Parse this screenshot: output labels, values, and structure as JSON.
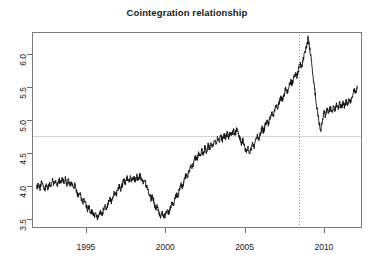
{
  "chart_data": {
    "type": "line",
    "title": "Cointegration relationship",
    "xlabel": "",
    "ylabel": "",
    "xlim": [
      1991.6,
      2012.4
    ],
    "ylim": [
      3.36,
      6.34
    ],
    "grid": false,
    "legend": null,
    "x_ticks": [
      1995,
      2000,
      2005,
      2010
    ],
    "x_tick_labels": [
      "1995",
      "2000",
      "2005",
      "2010"
    ],
    "y_ticks": [
      3.5,
      4.0,
      4.5,
      5.0,
      5.5,
      6.0
    ],
    "y_tick_labels": [
      "3.5",
      "4.0",
      "4.5",
      "5.0",
      "5.5",
      "6.0"
    ],
    "series": [
      {
        "name": "cointegration-relationship",
        "color": "#111111",
        "x": [
          1991.9,
          1992.0,
          1992.1,
          1992.2,
          1992.3,
          1992.4,
          1992.5,
          1992.6,
          1992.7,
          1992.8,
          1992.9,
          1993.0,
          1993.1,
          1993.2,
          1993.3,
          1993.4,
          1993.5,
          1993.6,
          1993.7,
          1993.8,
          1993.9,
          1994.0,
          1994.1,
          1994.2,
          1994.3,
          1994.4,
          1994.5,
          1994.6,
          1994.7,
          1994.8,
          1994.9,
          1995.0,
          1995.1,
          1995.2,
          1995.3,
          1995.4,
          1995.5,
          1995.6,
          1995.7,
          1995.8,
          1995.9,
          1996.0,
          1996.1,
          1996.2,
          1996.3,
          1996.4,
          1996.5,
          1996.6,
          1996.7,
          1996.8,
          1996.9,
          1997.0,
          1997.1,
          1997.2,
          1997.3,
          1997.4,
          1997.5,
          1997.6,
          1997.7,
          1997.8,
          1997.9,
          1998.0,
          1998.1,
          1998.2,
          1998.3,
          1998.4,
          1998.5,
          1998.6,
          1998.7,
          1998.8,
          1998.9,
          1999.0,
          1999.1,
          1999.2,
          1999.3,
          1999.4,
          1999.5,
          1999.6,
          1999.7,
          1999.8,
          1999.9,
          2000.0,
          2000.1,
          2000.2,
          2000.3,
          2000.4,
          2000.5,
          2000.6,
          2000.7,
          2000.8,
          2000.9,
          2001.0,
          2001.1,
          2001.2,
          2001.3,
          2001.4,
          2001.5,
          2001.6,
          2001.7,
          2001.8,
          2001.9,
          2002.0,
          2002.1,
          2002.2,
          2002.3,
          2002.4,
          2002.5,
          2002.6,
          2002.7,
          2002.8,
          2002.9,
          2003.0,
          2003.1,
          2003.2,
          2003.3,
          2003.4,
          2003.5,
          2003.6,
          2003.7,
          2003.8,
          2003.9,
          2004.0,
          2004.1,
          2004.2,
          2004.3,
          2004.4,
          2004.5,
          2004.6,
          2004.7,
          2004.8,
          2004.9,
          2005.0,
          2005.1,
          2005.2,
          2005.3,
          2005.4,
          2005.5,
          2005.6,
          2005.7,
          2005.8,
          2005.9,
          2006.0,
          2006.1,
          2006.2,
          2006.3,
          2006.4,
          2006.5,
          2006.6,
          2006.7,
          2006.8,
          2006.9,
          2007.0,
          2007.1,
          2007.2,
          2007.3,
          2007.4,
          2007.5,
          2007.6,
          2007.7,
          2007.8,
          2007.9,
          2008.0,
          2008.1,
          2008.2,
          2008.3,
          2008.4,
          2008.5,
          2008.6,
          2008.7,
          2008.8,
          2008.9,
          2009.0,
          2009.1,
          2009.2,
          2009.3,
          2009.4,
          2009.5,
          2009.6,
          2009.7,
          2009.8,
          2009.9,
          2010.0,
          2010.1,
          2010.2,
          2010.3,
          2010.4,
          2010.5,
          2010.6,
          2010.7,
          2010.8,
          2010.9,
          2011.0,
          2011.1,
          2011.2,
          2011.3,
          2011.4,
          2011.5,
          2011.6,
          2011.7,
          2011.8,
          2011.9,
          2012.0,
          2012.1
        ],
        "y": [
          3.98,
          4.02,
          3.95,
          4.06,
          4.0,
          3.93,
          4.02,
          3.96,
          4.05,
          3.99,
          4.08,
          4.02,
          4.09,
          4.01,
          4.1,
          4.04,
          4.12,
          4.05,
          4.11,
          4.03,
          4.09,
          4.01,
          4.06,
          3.97,
          4.02,
          3.92,
          3.86,
          3.9,
          3.82,
          3.75,
          3.79,
          3.7,
          3.64,
          3.68,
          3.58,
          3.62,
          3.54,
          3.58,
          3.5,
          3.55,
          3.6,
          3.56,
          3.63,
          3.7,
          3.66,
          3.74,
          3.8,
          3.76,
          3.84,
          3.9,
          3.86,
          3.94,
          4.0,
          3.95,
          4.03,
          4.09,
          4.04,
          4.12,
          4.06,
          4.13,
          4.07,
          4.14,
          4.08,
          4.15,
          4.09,
          4.16,
          4.1,
          4.04,
          4.09,
          4.01,
          3.95,
          3.88,
          3.8,
          3.84,
          3.74,
          3.66,
          3.7,
          3.6,
          3.54,
          3.58,
          3.5,
          3.56,
          3.62,
          3.57,
          3.66,
          3.74,
          3.7,
          3.8,
          3.88,
          3.84,
          3.94,
          4.02,
          3.98,
          4.08,
          4.16,
          4.12,
          4.22,
          4.3,
          4.26,
          4.36,
          4.44,
          4.4,
          4.5,
          4.44,
          4.54,
          4.48,
          4.58,
          4.52,
          4.62,
          4.56,
          4.66,
          4.6,
          4.7,
          4.64,
          4.74,
          4.68,
          4.76,
          4.7,
          4.78,
          4.72,
          4.8,
          4.74,
          4.82,
          4.76,
          4.84,
          4.78,
          4.86,
          4.8,
          4.72,
          4.64,
          4.7,
          4.6,
          4.52,
          4.58,
          4.48,
          4.56,
          4.64,
          4.58,
          4.68,
          4.76,
          4.7,
          4.8,
          4.88,
          4.82,
          4.92,
          5.0,
          4.94,
          5.04,
          5.12,
          5.06,
          5.16,
          5.24,
          5.18,
          5.28,
          5.36,
          5.3,
          5.4,
          5.48,
          5.42,
          5.52,
          5.6,
          5.54,
          5.64,
          5.72,
          5.66,
          5.78,
          5.86,
          5.8,
          5.92,
          6.04,
          6.12,
          6.24,
          6.1,
          5.92,
          5.7,
          5.5,
          5.3,
          5.12,
          4.96,
          4.82,
          5.0,
          5.14,
          5.06,
          5.18,
          5.1,
          5.2,
          5.12,
          5.22,
          5.14,
          5.24,
          5.16,
          5.26,
          5.18,
          5.28,
          5.2,
          5.3,
          5.22,
          5.32,
          5.26,
          5.38,
          5.46,
          5.4,
          5.52
        ]
      }
    ],
    "reference_lines": [
      {
        "name": "mean-level-hline",
        "orientation": "horizontal",
        "value": 4.76,
        "color": "#d4d4d4",
        "style": "solid"
      },
      {
        "name": "break-date-vline",
        "orientation": "vertical",
        "value": 2008.45,
        "color": "#9a9a9a",
        "style": "dotted"
      }
    ],
    "axis_color": "#7a7a7a",
    "background": "#ffffff"
  }
}
